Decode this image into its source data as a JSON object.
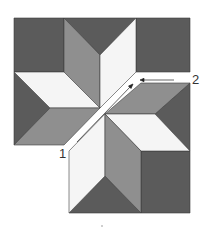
{
  "figure": {
    "type": "quilt-block-assembly-diagram",
    "labels": [
      {
        "id": "1",
        "text": "1",
        "meaning": "sew seam from this end toward center"
      },
      {
        "id": "2",
        "text": "2",
        "meaning": "sew seam inward from this end"
      }
    ],
    "colors": {
      "dark": "#5b5b5b",
      "medium": "#8f8f8f",
      "light": "#f5f5f5",
      "outline": "#3c3c3c",
      "arrow": "#222222"
    },
    "halves": [
      "upper-left",
      "lower-right"
    ]
  }
}
